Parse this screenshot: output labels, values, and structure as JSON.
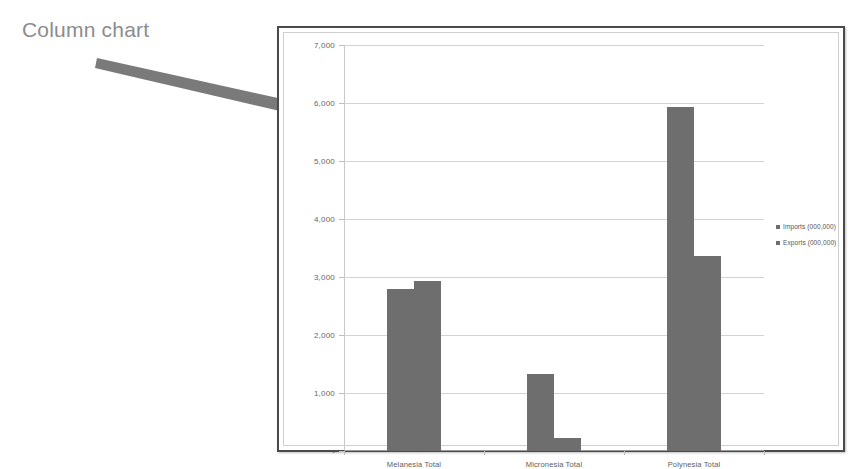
{
  "annotation": {
    "label": "Column chart",
    "arrow_icon": "arrow-right-down-icon",
    "color": "#8c8c8c"
  },
  "chart_frame": {
    "border_color": "#4a4a4a",
    "background": "#ffffff"
  },
  "chart_data": {
    "type": "bar",
    "title": "",
    "subtitle": "",
    "xlabel": "",
    "ylabel": "",
    "categories": [
      "Melanesia Total",
      "Micronesia Total",
      "Polynesia Total"
    ],
    "series": [
      {
        "name": "Imports (000,000)",
        "values": [
          2790,
          1330,
          5930
        ],
        "color": "#6e6e6e"
      },
      {
        "name": "Exports (000,000)",
        "values": [
          2930,
          230,
          3370
        ],
        "color": "#6e6e6e"
      }
    ],
    "ylim": [
      0,
      7000
    ],
    "ytick_values": [
      0,
      1000,
      2000,
      3000,
      4000,
      5000,
      6000,
      7000
    ],
    "ytick_labels": [
      "-",
      "1,000",
      "2,000",
      "3,000",
      "4,000",
      "5,000",
      "6,000",
      "7,000"
    ],
    "grid": true,
    "legend_position": "right",
    "legend": [
      "Imports (000,000)",
      "Exports (000,000)"
    ]
  }
}
